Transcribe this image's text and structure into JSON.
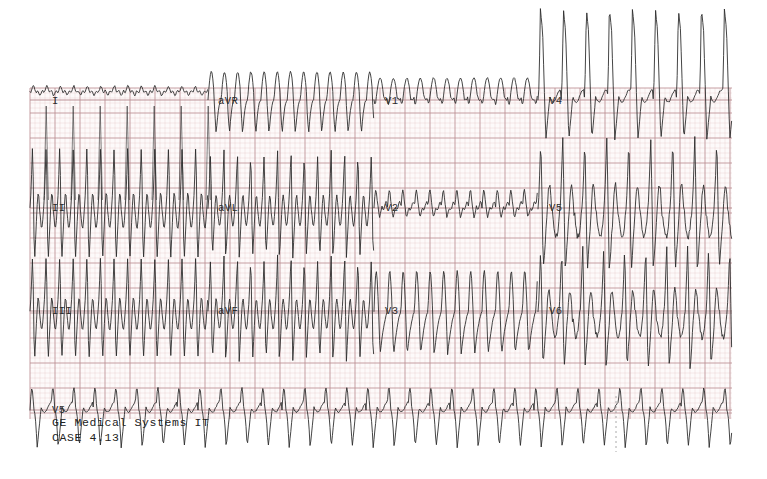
{
  "document": {
    "kind": "12-lead-electrocardiogram-printout",
    "background_color": "#ffffff",
    "paper_grid_minor_color": "#e3b9bd",
    "paper_grid_major_color": "#b98d92",
    "trace_color": "#2a2a2a",
    "paper": {
      "x": 30,
      "y": 88,
      "width": 702,
      "height": 331
    }
  },
  "grid": {
    "minor_step_px": 5,
    "major_step_px": 25,
    "minor_visible": true,
    "major_visible": true
  },
  "lead_labels": [
    {
      "text": "I",
      "x": 52,
      "y": 104,
      "row": 1,
      "column": 1
    },
    {
      "text": "aVR",
      "x": 218,
      "y": 104,
      "row": 1,
      "column": 2
    },
    {
      "text": "V1",
      "x": 385,
      "y": 104,
      "row": 1,
      "column": 3
    },
    {
      "text": "V4",
      "x": 549,
      "y": 104,
      "row": 1,
      "column": 4
    },
    {
      "text": "II",
      "x": 52,
      "y": 211,
      "row": 2,
      "column": 1
    },
    {
      "text": "aVL",
      "x": 218,
      "y": 211,
      "row": 2,
      "column": 2
    },
    {
      "text": "V2",
      "x": 385,
      "y": 211,
      "row": 2,
      "column": 3
    },
    {
      "text": "V5",
      "x": 549,
      "y": 211,
      "row": 2,
      "column": 4
    },
    {
      "text": "III",
      "x": 52,
      "y": 314,
      "row": 3,
      "column": 1
    },
    {
      "text": "aVF",
      "x": 218,
      "y": 314,
      "row": 3,
      "column": 2
    },
    {
      "text": "V3",
      "x": 385,
      "y": 314,
      "row": 3,
      "column": 3
    },
    {
      "text": "V6",
      "x": 549,
      "y": 314,
      "row": 3,
      "column": 4
    },
    {
      "text": "V5",
      "x": 52,
      "y": 413,
      "row": 4,
      "column": 1
    }
  ],
  "footer": {
    "manufacturer_line": "GE Medical Systems IT",
    "manufacturer_x": 52,
    "manufacturer_y": 426,
    "case_line": "CASE 4.13",
    "case_x": 52,
    "case_y": 441
  },
  "rows": [
    {
      "name": "row-1-limb-augmented",
      "baseline_y": 100,
      "segments": [
        "I",
        "aVR",
        "V1",
        "V4"
      ]
    },
    {
      "name": "row-2-limb-augmented",
      "baseline_y": 208,
      "segments": [
        "II",
        "aVL",
        "V2",
        "V5"
      ]
    },
    {
      "name": "row-3-limb-augmented",
      "baseline_y": 311,
      "segments": [
        "III",
        "aVF",
        "V3",
        "V6"
      ]
    },
    {
      "name": "row-4-rhythm-strip",
      "baseline_y": 410,
      "segments": [
        "V5"
      ]
    }
  ],
  "segment_bounds": [
    {
      "label": "col-1",
      "x_start": 30,
      "x_end": 208
    },
    {
      "label": "col-2",
      "x_start": 208,
      "x_end": 374
    },
    {
      "label": "col-3",
      "x_start": 374,
      "x_end": 538
    },
    {
      "label": "col-4",
      "x_start": 538,
      "x_end": 732
    }
  ],
  "chart_data": {
    "type": "line",
    "xlabel": "time",
    "ylabel": "amplitude (mV)",
    "grid": true,
    "legend_position": "inline-lead-labels",
    "notes": [
      "Very rapid wide-complex tachycardia across all leads",
      "Large amplitude complexes in II, III, aVF, V5, V6 overshoot row boundaries",
      "V4 complexes spike above top paper edge",
      "Tracing is a scanned paper printout with pink-red grid"
    ],
    "sampling": {
      "x_step_px": 1.0,
      "sweep_note": "25 mm/s equivalent grid"
    },
    "series": [
      {
        "name": "I",
        "baseline_y": 100,
        "x_start": 30,
        "x_end": 208,
        "shape": "low-amplitude-undulating-baseline",
        "cycle_px": 13.5,
        "amp_up_px": 9,
        "amp_down_px": 3,
        "overlap_spikes_down_px": 100
      },
      {
        "name": "aVR",
        "baseline_y": 100,
        "x_start": 208,
        "x_end": 374,
        "shape": "sawtooth-rounded-peak-sharp-trough",
        "cycle_px": 13.2,
        "amp_up_px": 28,
        "amp_down_px": 34
      },
      {
        "name": "V1",
        "baseline_y": 100,
        "x_start": 374,
        "x_end": 538,
        "shape": "small-humps-above-baseline",
        "cycle_px": 13.4,
        "amp_up_px": 22,
        "amp_down_px": 8
      },
      {
        "name": "V4",
        "baseline_y": 100,
        "x_start": 538,
        "x_end": 732,
        "shape": "very-tall-narrow-spikes-clipped-above-paper",
        "cycle_px": 23.0,
        "amp_up_px": 92,
        "amp_down_px": 40
      },
      {
        "name": "II",
        "baseline_y": 208,
        "x_start": 30,
        "x_end": 208,
        "shape": "very-large-biphasic-complexes",
        "cycle_px": 13.6,
        "amp_up_px": 70,
        "amp_down_px": 58
      },
      {
        "name": "aVL",
        "baseline_y": 208,
        "x_start": 208,
        "x_end": 374,
        "shape": "large-biphasic-complexes",
        "cycle_px": 13.4,
        "amp_up_px": 60,
        "amp_down_px": 52
      },
      {
        "name": "V2",
        "baseline_y": 208,
        "x_start": 374,
        "x_end": 538,
        "shape": "small-notched-complexes",
        "cycle_px": 13.5,
        "amp_up_px": 18,
        "amp_down_px": 10
      },
      {
        "name": "V5",
        "baseline_y": 208,
        "x_start": 538,
        "x_end": 732,
        "shape": "large-chaotic-complexes",
        "cycle_px": 22.0,
        "amp_up_px": 72,
        "amp_down_px": 64
      },
      {
        "name": "III",
        "baseline_y": 311,
        "x_start": 30,
        "x_end": 208,
        "shape": "large-biphasic-complexes",
        "cycle_px": 13.6,
        "amp_up_px": 62,
        "amp_down_px": 54
      },
      {
        "name": "aVF",
        "baseline_y": 311,
        "x_start": 208,
        "x_end": 374,
        "shape": "large-biphasic-complexes",
        "cycle_px": 13.4,
        "amp_up_px": 58,
        "amp_down_px": 52
      },
      {
        "name": "V3",
        "baseline_y": 311,
        "x_start": 374,
        "x_end": 538,
        "shape": "medium-sawtooth-complexes",
        "cycle_px": 13.5,
        "amp_up_px": 40,
        "amp_down_px": 44
      },
      {
        "name": "V6",
        "baseline_y": 311,
        "x_start": 538,
        "x_end": 732,
        "shape": "large-chaotic-complexes",
        "cycle_px": 21.0,
        "amp_up_px": 66,
        "amp_down_px": 58
      },
      {
        "name": "V5-rhythm",
        "baseline_y": 410,
        "x_start": 30,
        "x_end": 732,
        "shape": "continuous-rhythm-strip-deep-negative-spikes",
        "cycle_px": 21.0,
        "amp_up_px": 22,
        "amp_down_px": 38
      }
    ]
  },
  "marks": {
    "dashed_marker_x": 616,
    "dashed_marker_y_start": 396,
    "dashed_marker_y_end": 452,
    "dashed_marker_name": "event-marker-tick"
  }
}
